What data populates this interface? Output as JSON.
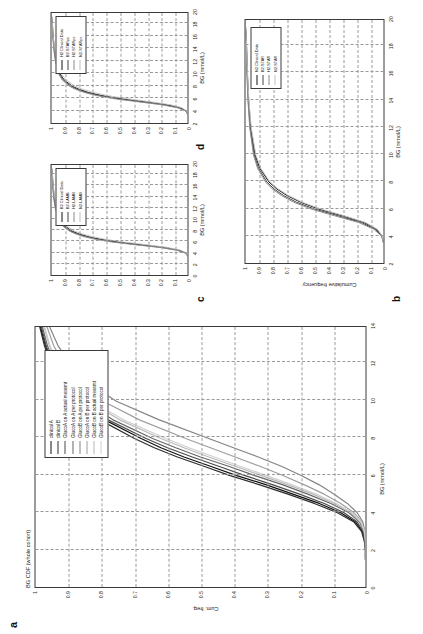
{
  "figure": {
    "orientation": "rotated-90-ccw",
    "panels": [
      "a",
      "b",
      "c",
      "d"
    ]
  },
  "panel_a": {
    "letter": "a",
    "title": "BG CDF (whole cohort)",
    "xlabel": "BG (mmol/L)",
    "ylabel": "Cum. freq.",
    "xticks": [
      "0",
      "2",
      "4",
      "6",
      "8",
      "10",
      "12",
      "14"
    ],
    "yticks": [
      "0",
      "0.1",
      "0.2",
      "0.3",
      "0.4",
      "0.5",
      "0.6",
      "0.7",
      "0.8",
      "0.9",
      "1"
    ],
    "legend": [
      {
        "label": "clinical A",
        "color": "#101010"
      },
      {
        "label": "clinical B",
        "color": "#2e2e2e"
      },
      {
        "label": "GlucoA on A actual measmt",
        "color": "#4a4a4a"
      },
      {
        "label": "GlucoA on A per protocol",
        "color": "#666666"
      },
      {
        "label": "GlucoB on A per protocol",
        "color": "#848484"
      },
      {
        "label": "GlucoA on B per protocol",
        "color": "#9e9e9e"
      },
      {
        "label": "GlucoB on B actual measmt",
        "color": "#b8b8b8"
      },
      {
        "label": "GlucoB on B per protocol",
        "color": "#d0d0d0"
      }
    ]
  },
  "panel_b": {
    "letter": "b",
    "xlabel": "BG (mmol/L)",
    "ylabel": "Cumulative frequency",
    "xticks": [
      "2",
      "4",
      "6",
      "8",
      "10",
      "12",
      "14",
      "16",
      "18",
      "20"
    ],
    "yticks": [
      "0",
      "0.1",
      "0.2",
      "0.3",
      "0.4",
      "0.5",
      "0.6",
      "0.7",
      "0.8",
      "0.9",
      "1"
    ],
    "legend": [
      {
        "label": "N2 Clinical Data",
        "color": "#101010"
      },
      {
        "label": "B2-STAR",
        "color": "#454545"
      },
      {
        "label": "H2-STAR",
        "color": "#8a8a8a"
      },
      {
        "label": "N2-STAR",
        "color": "#c0c0c0"
      }
    ]
  },
  "panel_c": {
    "letter": "c",
    "xlabel": "BG (mmol/L)",
    "xticks": [
      "0",
      "2",
      "4",
      "6",
      "8",
      "10",
      "12",
      "14",
      "16",
      "18",
      "20"
    ],
    "yticks": [
      "0",
      "0.1",
      "0.2",
      "0.3",
      "0.4",
      "0.5",
      "0.6",
      "0.7",
      "0.8",
      "0.9",
      "1"
    ],
    "legend": [
      {
        "label": "B2 Clinical Data",
        "color": "#101010"
      },
      {
        "label": "B2-LAMB",
        "color": "#454545"
      },
      {
        "label": "H2-LAMB",
        "color": "#8a8a8a"
      },
      {
        "label": "N2-LAMB",
        "color": "#c0c0c0"
      }
    ]
  },
  "panel_d": {
    "letter": "d",
    "xlabel": "BG (mmol/L)",
    "xticks": [
      "2",
      "4",
      "6",
      "8",
      "10",
      "12",
      "14",
      "16",
      "18",
      "20"
    ],
    "yticks": [
      "0",
      "0.1",
      "0.2",
      "0.3",
      "0.4",
      "0.5",
      "0.6",
      "0.7",
      "0.8",
      "0.9",
      "1"
    ],
    "legend": [
      {
        "label": "H2 Clinical Data",
        "color": "#101010"
      },
      {
        "label": "B2-STARpc",
        "color": "#454545"
      },
      {
        "label": "H2-STARpc",
        "color": "#8a8a8a"
      },
      {
        "label": "N2-STARpc",
        "color": "#c0c0c0"
      }
    ]
  },
  "chart_data": [
    {
      "type": "line",
      "panel": "a",
      "title": "BG CDF (whole cohort)",
      "xlabel": "BG (mmol/L)",
      "ylabel": "Cum. freq.",
      "xlim": [
        0,
        14
      ],
      "ylim": [
        0,
        1
      ],
      "grid": true,
      "legend_position": "upper-right-inside",
      "x": [
        1.5,
        2.0,
        2.5,
        3.0,
        3.5,
        4.0,
        4.5,
        5.0,
        5.5,
        6.0,
        6.5,
        7.0,
        7.5,
        8.0,
        9.0,
        10.0,
        11.0,
        12.0,
        13.0,
        14.0
      ],
      "series": [
        {
          "name": "clinical A",
          "color": "#101010",
          "values": [
            0.0,
            0.0,
            0.003,
            0.01,
            0.03,
            0.075,
            0.14,
            0.22,
            0.3,
            0.39,
            0.47,
            0.55,
            0.62,
            0.68,
            0.79,
            0.87,
            0.92,
            0.95,
            0.97,
            0.985
          ]
        },
        {
          "name": "clinical B",
          "color": "#2e2e2e",
          "values": [
            0.0,
            0.0,
            0.004,
            0.012,
            0.035,
            0.085,
            0.155,
            0.235,
            0.32,
            0.41,
            0.49,
            0.57,
            0.64,
            0.7,
            0.805,
            0.88,
            0.925,
            0.955,
            0.973,
            0.987
          ]
        },
        {
          "name": "GlucoA on A actual measmt",
          "color": "#4a4a4a",
          "values": [
            0.0,
            0.0,
            0.002,
            0.008,
            0.025,
            0.065,
            0.125,
            0.2,
            0.28,
            0.365,
            0.445,
            0.525,
            0.6,
            0.665,
            0.78,
            0.865,
            0.915,
            0.948,
            0.968,
            0.982
          ]
        },
        {
          "name": "GlucoA on A per protocol",
          "color": "#666666",
          "values": [
            0.0,
            0.0,
            0.001,
            0.005,
            0.018,
            0.05,
            0.105,
            0.175,
            0.25,
            0.335,
            0.415,
            0.5,
            0.575,
            0.645,
            0.765,
            0.855,
            0.908,
            0.942,
            0.964,
            0.979
          ]
        },
        {
          "name": "GlucoB on A per protocol",
          "color": "#848484",
          "values": [
            0.0,
            0.0,
            0.0,
            0.002,
            0.008,
            0.025,
            0.055,
            0.095,
            0.14,
            0.195,
            0.255,
            0.325,
            0.4,
            0.475,
            0.625,
            0.755,
            0.84,
            0.895,
            0.932,
            0.957
          ]
        },
        {
          "name": "GlucoA on B per protocol",
          "color": "#9e9e9e",
          "values": [
            0.0,
            0.0,
            0.0,
            0.003,
            0.012,
            0.035,
            0.075,
            0.125,
            0.185,
            0.25,
            0.32,
            0.395,
            0.47,
            0.545,
            0.685,
            0.795,
            0.868,
            0.915,
            0.945,
            0.965
          ]
        },
        {
          "name": "GlucoB on B actual measmt",
          "color": "#b8b8b8",
          "values": [
            0.0,
            0.0,
            0.0,
            0.004,
            0.015,
            0.045,
            0.095,
            0.16,
            0.235,
            0.315,
            0.395,
            0.475,
            0.55,
            0.62,
            0.745,
            0.84,
            0.898,
            0.935,
            0.958,
            0.974
          ]
        },
        {
          "name": "GlucoB on B per protocol",
          "color": "#d0d0d0",
          "values": [
            0.0,
            0.0,
            0.0,
            0.003,
            0.013,
            0.04,
            0.088,
            0.15,
            0.222,
            0.3,
            0.38,
            0.458,
            0.535,
            0.605,
            0.733,
            0.832,
            0.892,
            0.932,
            0.956,
            0.972
          ]
        }
      ]
    },
    {
      "type": "line",
      "panel": "b",
      "xlabel": "BG (mmol/L)",
      "ylabel": "Cumulative frequency",
      "xlim": [
        2,
        20
      ],
      "ylim": [
        0,
        1
      ],
      "grid": true,
      "legend_position": "upper-right-inside",
      "x": [
        3.5,
        4.0,
        4.5,
        5.0,
        5.5,
        6.0,
        6.5,
        7.0,
        7.5,
        8.0,
        9.0,
        10.0,
        12.0,
        14.0,
        16.0,
        18.0,
        19.5
      ],
      "series": [
        {
          "name": "N2 Clinical Data",
          "color": "#101010",
          "values": [
            0.0,
            0.01,
            0.05,
            0.14,
            0.3,
            0.47,
            0.6,
            0.7,
            0.775,
            0.83,
            0.895,
            0.93,
            0.962,
            0.977,
            0.986,
            0.992,
            1.0
          ]
        },
        {
          "name": "B2-STAR",
          "color": "#454545",
          "values": [
            0.0,
            0.012,
            0.06,
            0.16,
            0.33,
            0.5,
            0.63,
            0.725,
            0.795,
            0.845,
            0.905,
            0.937,
            0.966,
            0.98,
            0.988,
            0.993,
            1.0
          ]
        },
        {
          "name": "H2-STAR",
          "color": "#8a8a8a",
          "values": [
            0.0,
            0.015,
            0.07,
            0.18,
            0.355,
            0.525,
            0.65,
            0.74,
            0.808,
            0.855,
            0.912,
            0.942,
            0.969,
            0.982,
            0.99,
            0.995,
            1.0
          ]
        },
        {
          "name": "N2-STAR",
          "color": "#c0c0c0",
          "values": [
            0.0,
            0.008,
            0.045,
            0.13,
            0.285,
            0.455,
            0.588,
            0.688,
            0.765,
            0.822,
            0.888,
            0.925,
            0.958,
            0.975,
            0.985,
            0.991,
            1.0
          ]
        }
      ]
    },
    {
      "type": "line",
      "panel": "c",
      "xlabel": "BG (mmol/L)",
      "xlim": [
        0,
        20
      ],
      "ylim": [
        0,
        1
      ],
      "grid": true,
      "legend_position": "upper-right-inside",
      "x": [
        3.5,
        4.0,
        4.5,
        5.0,
        5.5,
        6.0,
        6.5,
        7.0,
        7.5,
        8.0,
        9.0,
        10.0,
        12.0,
        14.0,
        16.0,
        18.0,
        19.5
      ],
      "series": [
        {
          "name": "B2 Clinical Data",
          "color": "#101010",
          "values": [
            0.0,
            0.012,
            0.06,
            0.165,
            0.34,
            0.51,
            0.64,
            0.735,
            0.8,
            0.85,
            0.908,
            0.938,
            0.966,
            0.979,
            0.987,
            0.993,
            1.0
          ]
        },
        {
          "name": "B2-LAMB",
          "color": "#454545",
          "values": [
            0.0,
            0.015,
            0.07,
            0.185,
            0.365,
            0.535,
            0.662,
            0.752,
            0.815,
            0.862,
            0.916,
            0.945,
            0.97,
            0.982,
            0.99,
            0.995,
            1.0
          ]
        },
        {
          "name": "H2-LAMB",
          "color": "#8a8a8a",
          "values": [
            0.0,
            0.018,
            0.08,
            0.2,
            0.385,
            0.555,
            0.678,
            0.765,
            0.826,
            0.87,
            0.922,
            0.949,
            0.972,
            0.984,
            0.991,
            0.996,
            1.0
          ]
        },
        {
          "name": "N2-LAMB",
          "color": "#c0c0c0",
          "values": [
            0.0,
            0.009,
            0.05,
            0.145,
            0.3,
            0.47,
            0.605,
            0.705,
            0.778,
            0.832,
            0.894,
            0.929,
            0.96,
            0.976,
            0.986,
            0.992,
            1.0
          ]
        }
      ]
    },
    {
      "type": "line",
      "panel": "d",
      "xlabel": "BG (mmol/L)",
      "xlim": [
        2,
        20
      ],
      "ylim": [
        0,
        1
      ],
      "grid": true,
      "legend_position": "upper-right-inside",
      "x": [
        3.5,
        4.0,
        4.5,
        5.0,
        5.5,
        6.0,
        6.5,
        7.0,
        7.5,
        8.0,
        9.0,
        10.0,
        12.0,
        14.0,
        16.0,
        18.0,
        19.5
      ],
      "series": [
        {
          "name": "H2 Clinical Data",
          "color": "#101010",
          "values": [
            0.0,
            0.01,
            0.055,
            0.155,
            0.325,
            0.5,
            0.632,
            0.728,
            0.795,
            0.845,
            0.905,
            0.936,
            0.965,
            0.978,
            0.987,
            0.993,
            1.0
          ]
        },
        {
          "name": "B2-STARpc",
          "color": "#454545",
          "values": [
            0.0,
            0.013,
            0.065,
            0.175,
            0.35,
            0.525,
            0.652,
            0.745,
            0.81,
            0.858,
            0.913,
            0.943,
            0.968,
            0.981,
            0.989,
            0.994,
            1.0
          ]
        },
        {
          "name": "H2-STARpc",
          "color": "#8a8a8a",
          "values": [
            0.0,
            0.016,
            0.075,
            0.195,
            0.375,
            0.548,
            0.672,
            0.76,
            0.822,
            0.867,
            0.92,
            0.947,
            0.971,
            0.983,
            0.99,
            0.995,
            1.0
          ]
        },
        {
          "name": "N2-STARpc",
          "color": "#c0c0c0",
          "values": [
            0.0,
            0.007,
            0.042,
            0.128,
            0.282,
            0.452,
            0.59,
            0.692,
            0.768,
            0.825,
            0.89,
            0.927,
            0.959,
            0.976,
            0.986,
            0.992,
            1.0
          ]
        }
      ]
    }
  ]
}
